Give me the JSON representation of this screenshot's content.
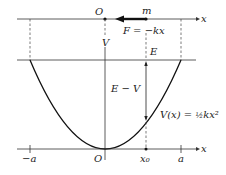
{
  "diagram": {
    "top_axis": {
      "axis_label": "x",
      "origin_label": "O",
      "mass_label": "m",
      "force_label": "F = −kx"
    },
    "energy_level": {
      "label": "E",
      "difference_label": "E − V",
      "potential_axis_label": "V"
    },
    "curve": {
      "label_prefix": "V(x) = ",
      "label_frac": "½",
      "label_suffix": "kx²"
    },
    "bottom_axis": {
      "axis_label": "x",
      "ticks": [
        "−a",
        "O",
        "x₀",
        "a"
      ]
    },
    "colors": {
      "line": "#222222",
      "dashed": "#444444",
      "background": "#ffffff"
    }
  }
}
